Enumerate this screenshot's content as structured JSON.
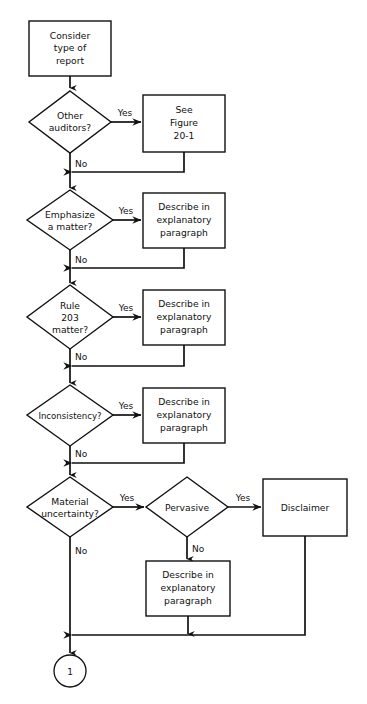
{
  "diagram": {
    "type": "flowchart",
    "background_color": "#ffffff",
    "line_color": "#111111",
    "shape_fill": "#ffffff"
  },
  "nodes": {
    "start": {
      "shape": "rectangle",
      "lines": [
        "Consider",
        "type of",
        "report"
      ],
      "l0": "Consider",
      "l1": "type of",
      "l2": "report"
    },
    "d_other_auditors": {
      "shape": "diamond",
      "l0": "Other",
      "l1": "auditors?"
    },
    "b_see_figure": {
      "shape": "rectangle",
      "l0": "See",
      "l1": "Figure",
      "l2": "20-1"
    },
    "d_emphasize": {
      "shape": "diamond",
      "l0": "Emphasize",
      "l1": "a matter?"
    },
    "b_describe_1": {
      "shape": "rectangle",
      "l0": "Describe in",
      "l1": "explanatory",
      "l2": "paragraph"
    },
    "d_rule203": {
      "shape": "diamond",
      "l0": "Rule",
      "l1": "203",
      "l2": "matter?"
    },
    "b_describe_2": {
      "shape": "rectangle",
      "l0": "Describe in",
      "l1": "explanatory",
      "l2": "paragraph"
    },
    "d_inconsistency": {
      "shape": "diamond",
      "l0": "Inconsistency?"
    },
    "b_describe_3": {
      "shape": "rectangle",
      "l0": "Describe in",
      "l1": "explanatory",
      "l2": "paragraph"
    },
    "d_material_uncertainty": {
      "shape": "diamond",
      "l0": "Material",
      "l1": "uncertainty?"
    },
    "d_pervasive": {
      "shape": "diamond",
      "l0": "Pervasive"
    },
    "b_disclaimer": {
      "shape": "rectangle",
      "l0": "Disclaimer"
    },
    "b_describe_4": {
      "shape": "rectangle",
      "l0": "Describe in",
      "l1": "explanatory",
      "l2": "paragraph"
    },
    "connector_end": {
      "shape": "circle",
      "l0": "1"
    }
  },
  "edges": {
    "other_yes": "Yes",
    "other_no": "No",
    "emphasize_yes": "Yes",
    "emphasize_no": "No",
    "rule203_yes": "Yes",
    "rule203_no": "No",
    "inconsistency_yes": "Yes",
    "inconsistency_no": "No",
    "material_yes": "Yes",
    "material_no": "No",
    "pervasive_yes": "Yes",
    "pervasive_no": "No"
  }
}
